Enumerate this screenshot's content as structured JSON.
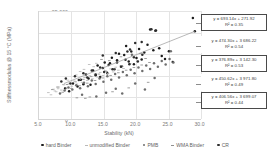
{
  "chart_data": {
    "type": "scatter",
    "title": "",
    "xlabel": "Stability (kN)",
    "ylabel": "Stiffnessmodulus @ 15 °C (MPa)",
    "xlim": [
      5.0,
      30.0
    ],
    "ylim": [
      0,
      25000
    ],
    "xticks": [
      "5.0",
      "10.0",
      "15.0",
      "20.0",
      "25.0",
      "30.0"
    ],
    "yticks": [
      "0",
      "5 000",
      "10 000",
      "15 000",
      "20 000",
      "25 000"
    ],
    "grid": true,
    "legend_position": "bottom",
    "series": [
      {
        "name": "hard Binder",
        "marker": "circle",
        "color": "#1c1c1c",
        "trendline": {
          "equation": "y = 693.14x + 271.92",
          "r2": "R² = 0.35",
          "slope": 693.14,
          "intercept": 271.92,
          "r2_value": 0.35
        },
        "points": [
          [
            9.2,
            7100
          ],
          [
            9.8,
            6400
          ],
          [
            10.4,
            8200
          ],
          [
            11.1,
            7500
          ],
          [
            11.6,
            9100
          ],
          [
            12.0,
            8050
          ],
          [
            12.4,
            10300
          ],
          [
            12.8,
            9350
          ],
          [
            13.1,
            7900
          ],
          [
            13.5,
            11200
          ],
          [
            13.9,
            10100
          ],
          [
            14.2,
            12400
          ],
          [
            14.6,
            9700
          ],
          [
            15.0,
            11800
          ],
          [
            15.3,
            13100
          ],
          [
            15.7,
            10600
          ],
          [
            16.1,
            12900
          ],
          [
            16.4,
            14200
          ],
          [
            16.8,
            11500
          ],
          [
            17.2,
            13600
          ],
          [
            17.5,
            15100
          ],
          [
            17.9,
            12200
          ],
          [
            18.3,
            14800
          ],
          [
            18.6,
            16900
          ],
          [
            19.0,
            13300
          ],
          [
            19.4,
            15600
          ],
          [
            19.8,
            12700
          ],
          [
            20.2,
            14100
          ],
          [
            20.6,
            16200
          ],
          [
            21.0,
            13800
          ],
          [
            21.4,
            15400
          ],
          [
            21.9,
            17200
          ],
          [
            22.3,
            20700
          ],
          [
            22.8,
            15900
          ],
          [
            23.2,
            20500
          ],
          [
            23.7,
            16400
          ],
          [
            24.1,
            14600
          ],
          [
            24.6,
            13900
          ],
          [
            25.2,
            15700
          ],
          [
            25.8,
            13200
          ],
          [
            28.9,
            23400
          ],
          [
            29.2,
            20300
          ]
        ]
      },
      {
        "name": "unmodified Binder",
        "marker": "dash",
        "color": "#b9b9b9",
        "trendline": {
          "equation": "y = 474.30x + 3 686.22",
          "r2": "R² = 0.54",
          "slope": 474.3,
          "intercept": 3686.22,
          "r2_value": 0.54
        },
        "points": [
          [
            6.6,
            6100
          ],
          [
            7.0,
            5600
          ],
          [
            7.4,
            6900
          ],
          [
            7.8,
            6300
          ],
          [
            8.2,
            7400
          ],
          [
            8.6,
            6700
          ],
          [
            9.0,
            7900
          ],
          [
            9.4,
            7200
          ],
          [
            9.8,
            8300
          ],
          [
            10.2,
            7600
          ],
          [
            10.6,
            8800
          ],
          [
            11.0,
            8100
          ],
          [
            11.4,
            9200
          ],
          [
            11.8,
            8500
          ],
          [
            12.2,
            9600
          ],
          [
            12.6,
            8900
          ],
          [
            13.0,
            10000
          ],
          [
            13.4,
            9300
          ],
          [
            13.8,
            10400
          ],
          [
            14.2,
            9700
          ],
          [
            14.6,
            10800
          ],
          [
            15.0,
            10100
          ],
          [
            15.4,
            11200
          ],
          [
            15.8,
            10500
          ],
          [
            16.2,
            11600
          ],
          [
            16.6,
            10900
          ],
          [
            17.0,
            12000
          ],
          [
            17.4,
            11300
          ],
          [
            17.8,
            12400
          ],
          [
            18.2,
            11700
          ],
          [
            12.9,
            12600
          ],
          [
            13.6,
            12100
          ],
          [
            14.0,
            12900
          ],
          [
            11.5,
            11000
          ],
          [
            10.9,
            10200
          ],
          [
            9.6,
            9000
          ],
          [
            8.9,
            8000
          ],
          [
            8.1,
            7000
          ],
          [
            7.6,
            6500
          ],
          [
            12.1,
            11500
          ]
        ]
      },
      {
        "name": "PMB",
        "marker": "circle",
        "color": "#6e6e6e",
        "trendline": {
          "equation": "y = 376.89x + 3 142.30",
          "r2": "R² = 0.53",
          "slope": 376.89,
          "intercept": 3142.3,
          "r2_value": 0.53
        },
        "points": [
          [
            8.4,
            5900
          ],
          [
            9.1,
            6600
          ],
          [
            9.7,
            7300
          ],
          [
            10.3,
            6800
          ],
          [
            10.9,
            7800
          ],
          [
            11.5,
            7100
          ],
          [
            12.1,
            8400
          ],
          [
            12.7,
            7600
          ],
          [
            13.3,
            8900
          ],
          [
            13.9,
            8100
          ],
          [
            14.5,
            9400
          ],
          [
            15.1,
            8600
          ],
          [
            15.7,
            9900
          ],
          [
            16.3,
            9100
          ],
          [
            16.9,
            10400
          ],
          [
            17.5,
            9600
          ],
          [
            18.1,
            10900
          ],
          [
            18.7,
            10100
          ],
          [
            19.3,
            11400
          ],
          [
            19.9,
            10600
          ],
          [
            20.5,
            11900
          ],
          [
            21.1,
            11100
          ],
          [
            21.7,
            12400
          ],
          [
            22.3,
            11600
          ],
          [
            22.9,
            12900
          ],
          [
            23.5,
            12100
          ],
          [
            24.1,
            13400
          ],
          [
            24.7,
            12600
          ],
          [
            25.3,
            13900
          ],
          [
            25.9,
            13100
          ],
          [
            14.0,
            5200
          ],
          [
            15.5,
            6100
          ],
          [
            11.8,
            5600
          ],
          [
            17.0,
            7000
          ],
          [
            20.0,
            8200
          ],
          [
            23.0,
            9500
          ],
          [
            25.5,
            15700
          ],
          [
            19.5,
            14900
          ],
          [
            18.0,
            5900
          ],
          [
            21.5,
            6800
          ]
        ]
      },
      {
        "name": "WMA Binder",
        "marker": "dash",
        "color": "#8f8f8f",
        "trendline": {
          "equation": "y = 450.62x + 3 971.80",
          "r2": "R² = 0.49",
          "slope": 450.62,
          "intercept": 3971.8,
          "r2_value": 0.49
        },
        "points": [
          [
            7.2,
            6800
          ],
          [
            8.0,
            7400
          ],
          [
            8.8,
            6200
          ],
          [
            9.5,
            8000
          ],
          [
            10.1,
            7100
          ],
          [
            10.8,
            8600
          ],
          [
            11.4,
            7700
          ],
          [
            12.0,
            9200
          ],
          [
            12.6,
            8300
          ],
          [
            13.2,
            9800
          ],
          [
            13.8,
            8900
          ],
          [
            14.4,
            10400
          ],
          [
            15.0,
            9500
          ],
          [
            15.6,
            11000
          ],
          [
            16.2,
            10100
          ],
          [
            16.8,
            11600
          ],
          [
            17.4,
            10700
          ],
          [
            18.0,
            12200
          ],
          [
            18.6,
            11300
          ],
          [
            19.2,
            12800
          ],
          [
            19.8,
            11900
          ],
          [
            20.4,
            13400
          ],
          [
            21.0,
            12500
          ],
          [
            21.6,
            14000
          ],
          [
            22.2,
            13100
          ],
          [
            12.3,
            4800
          ],
          [
            13.0,
            5100
          ],
          [
            11.0,
            4900
          ],
          [
            16.5,
            6300
          ],
          [
            19.0,
            7200
          ],
          [
            22.0,
            8500
          ],
          [
            14.8,
            13800
          ],
          [
            16.0,
            13500
          ],
          [
            17.8,
            14400
          ],
          [
            20.8,
            15200
          ]
        ]
      },
      {
        "name": "CR",
        "marker": "circle",
        "color": "#2e2e2e",
        "trendline": {
          "equation": "y = 406.56x + 3 699.07",
          "r2": "R² = 0.44",
          "slope": 406.56,
          "intercept": 3699.07,
          "r2_value": 0.44
        },
        "points": [
          [
            8.6,
            8700
          ],
          [
            9.3,
            9400
          ],
          [
            10.0,
            8200
          ],
          [
            10.7,
            9900
          ],
          [
            11.3,
            9000
          ],
          [
            12.0,
            10600
          ],
          [
            12.6,
            9600
          ],
          [
            13.3,
            11200
          ],
          [
            13.9,
            10300
          ],
          [
            14.6,
            11900
          ],
          [
            15.2,
            10900
          ],
          [
            15.9,
            12500
          ],
          [
            16.5,
            11500
          ],
          [
            17.2,
            13100
          ],
          [
            17.8,
            12100
          ],
          [
            18.5,
            13700
          ],
          [
            19.1,
            12700
          ],
          [
            19.8,
            14300
          ],
          [
            20.4,
            13300
          ],
          [
            21.1,
            14900
          ],
          [
            22.5,
            20800
          ],
          [
            23.1,
            20400
          ],
          [
            20.0,
            17600
          ],
          [
            21.0,
            17800
          ],
          [
            19.2,
            16100
          ],
          [
            17.0,
            15300
          ],
          [
            15.0,
            14700
          ],
          [
            18.8,
            15600
          ]
        ]
      }
    ],
    "overall_trendline": {
      "x1": 9.0,
      "y1": 8200,
      "x2": 29.2,
      "y2": 20300
    },
    "annotations": [
      {
        "id": "eq-hard-binder",
        "equation": "y = 693.14x + 271.92",
        "r2": "R² = 0.35"
      },
      {
        "id": "eq-unmodified-binder",
        "equation": "y = 474.30x + 3 686.22",
        "r2": "R² = 0.54"
      },
      {
        "id": "eq-pmb",
        "equation": "y = 376.89x + 3 142.30",
        "r2": "R² = 0.53"
      },
      {
        "id": "eq-wma-binder",
        "equation": "y = 450.62x + 3 971.80",
        "r2": "R² = 0.49"
      },
      {
        "id": "eq-cr",
        "equation": "y = 406.56x + 3 699.07",
        "r2": "R² = 0.44"
      }
    ]
  }
}
